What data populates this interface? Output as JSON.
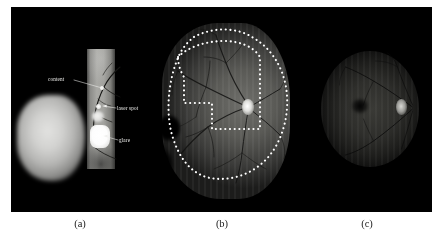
{
  "figure": {
    "background_color": "#ffffff",
    "panel_background_color": "#000000",
    "annotation_text_color": "#f0f0ee",
    "contour_color": "#ffffff",
    "caption_color": "#1a1a1a"
  },
  "panels": [
    {
      "id": "a",
      "caption": "(a)",
      "description": "raw wide-field montage frame with artefacts",
      "annotations": [
        {
          "name": "content",
          "label": "content"
        },
        {
          "name": "laser-spot",
          "label": "laser spot"
        },
        {
          "name": "glare",
          "label": "glare"
        }
      ]
    },
    {
      "id": "b",
      "caption": "(b)",
      "description": "stitched fundus montage with two dashed region contours",
      "annotations": []
    },
    {
      "id": "c",
      "caption": "(c)",
      "description": "low-illumination fundus image",
      "annotations": []
    }
  ],
  "captions": {
    "a": "(a)",
    "b": "(b)",
    "c": "(c)"
  },
  "labels": {
    "content": "content",
    "laser_spot": "laser spot",
    "glare": "glare"
  }
}
